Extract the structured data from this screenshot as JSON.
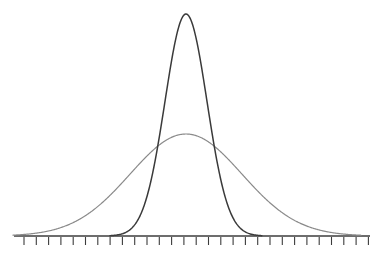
{
  "figure": {
    "background_color": "#ffffff",
    "clipped_caption": "",
    "axis": {
      "color": "#3c3c3c",
      "line_width": 1.4,
      "y": 236,
      "x_start": 14,
      "x_end": 370,
      "tick_count": 29,
      "tick_first_x": 24,
      "tick_spacing": 12.3,
      "tick_length": 8,
      "tick_width": 1.1,
      "tick_color": "#3c3c3c"
    }
  },
  "chart_data": {
    "type": "line",
    "title": "",
    "subtitle": "",
    "xlabel": "",
    "ylabel": "",
    "grid": false,
    "legend": "none",
    "xlim": [
      0,
      383
    ],
    "ylim": [
      0,
      236
    ],
    "baseline_y": 236,
    "center_x": 186,
    "annotations": [],
    "tick_labels": [],
    "series": [
      {
        "name": "narrow-normal-curve",
        "description": "tall narrow Gaussian, small standard deviation",
        "color": "#3a3a3a",
        "line_width": 1.5,
        "peak_x": 186,
        "peak_y": 14,
        "amplitude": 222,
        "sigma": 21,
        "x_start": 110,
        "x_end": 262
      },
      {
        "name": "wide-normal-curve",
        "description": "short wide Gaussian, large standard deviation",
        "color": "#8a8a8a",
        "line_width": 1.2,
        "peak_x": 186,
        "peak_y": 134,
        "amplitude": 102,
        "sigma": 56,
        "x_start": 13,
        "x_end": 361
      }
    ]
  }
}
